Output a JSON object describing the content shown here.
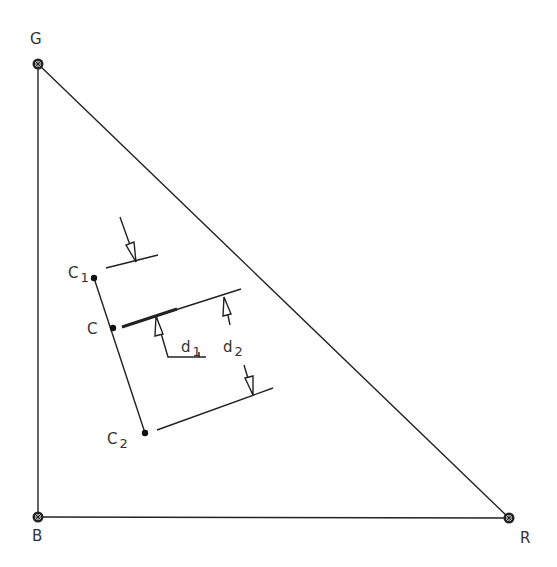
{
  "diagram": {
    "type": "color-triangle",
    "vertices": {
      "G": {
        "label": "G",
        "x": 38,
        "y": 64
      },
      "B": {
        "label": "B",
        "x": 38,
        "y": 517
      },
      "R": {
        "label": "R",
        "x": 509,
        "y": 518
      }
    },
    "points": {
      "C1": {
        "label": "C",
        "sub": "1",
        "x": 94,
        "y": 278
      },
      "C": {
        "label": "C",
        "sub": "",
        "x": 113,
        "y": 328
      },
      "C2": {
        "label": "C",
        "sub": "2",
        "x": 145,
        "y": 433
      }
    },
    "dimensions": {
      "d1": {
        "label": "d",
        "sub": "1"
      },
      "d2": {
        "label": "d",
        "sub": "2"
      }
    },
    "colors": {
      "stroke": "#222222",
      "text": "#333333",
      "background": "#ffffff"
    }
  }
}
